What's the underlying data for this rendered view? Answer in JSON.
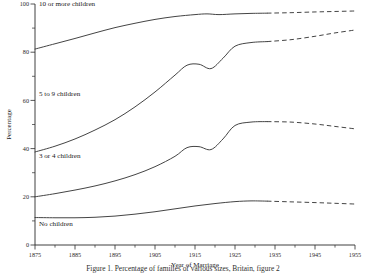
{
  "chart_data": {
    "type": "line",
    "title": "",
    "xlabel": "Year of Marriage",
    "ylabel": "Percentage",
    "xlim": [
      1875,
      1955
    ],
    "ylim": [
      0,
      100
    ],
    "grid": false,
    "legend_position": "inline-labels",
    "x_ticks": [
      "1875",
      "1885",
      "1895",
      "1905",
      "1915",
      "1925",
      "1935",
      "1945",
      "1955"
    ],
    "x_ticks_values": [
      1875,
      1885,
      1895,
      1905,
      1915,
      1925,
      1935,
      1945,
      1955
    ],
    "x_minor_step": 5,
    "y_ticks": [
      "0",
      "20",
      "40",
      "60",
      "80",
      "100"
    ],
    "y_ticks_values": [
      0,
      20,
      40,
      60,
      80,
      100
    ],
    "y_minor_step": 10,
    "projection_note": "dashed segments from 1933 onward are projected",
    "projection_start_year": 1933,
    "series": [
      {
        "name": "10 or more children",
        "label": "10 or more children",
        "label_x": 1876,
        "label_y": 99,
        "x": [
          1875,
          1880,
          1885,
          1890,
          1895,
          1900,
          1905,
          1910,
          1915,
          1918,
          1921,
          1925,
          1929,
          1933,
          1939,
          1945,
          1950,
          1955
        ],
        "values": [
          81.3,
          83.5,
          85.7,
          88.0,
          90.2,
          92.0,
          93.6,
          94.8,
          95.6,
          95.9,
          95.6,
          95.9,
          96.1,
          96.2,
          96.4,
          96.7,
          96.9,
          97.1
        ]
      },
      {
        "name": "5 to 9 children",
        "label": "5 to 9 children",
        "label_x": 1876,
        "label_y": 62,
        "x": [
          1875,
          1880,
          1885,
          1890,
          1895,
          1900,
          1905,
          1910,
          1913,
          1916,
          1919,
          1922,
          1925,
          1929,
          1933,
          1939,
          1945,
          1950,
          1955
        ],
        "values": [
          38.6,
          41.0,
          44.0,
          47.7,
          52.0,
          57.3,
          63.5,
          70.5,
          74.6,
          75.0,
          73.2,
          77.5,
          82.5,
          84.0,
          84.4,
          85.2,
          86.6,
          88.0,
          89.2
        ]
      },
      {
        "name": "3 or 4 children",
        "label": "3 or 4 children",
        "label_x": 1876,
        "label_y": 36,
        "x": [
          1875,
          1880,
          1885,
          1890,
          1895,
          1900,
          1905,
          1910,
          1913,
          1916,
          1919,
          1922,
          1925,
          1929,
          1933,
          1939,
          1945,
          1950,
          1955
        ],
        "values": [
          20.0,
          21.3,
          22.8,
          24.5,
          26.6,
          29.2,
          32.5,
          36.8,
          40.4,
          40.8,
          39.6,
          44.0,
          49.6,
          51.0,
          51.2,
          51.0,
          50.2,
          49.2,
          48.2
        ]
      },
      {
        "name": "No children",
        "label": "No children",
        "label_x": 1876,
        "label_y": 8,
        "x": [
          1875,
          1880,
          1885,
          1890,
          1895,
          1900,
          1905,
          1910,
          1915,
          1920,
          1925,
          1929,
          1933,
          1939,
          1945,
          1950,
          1955
        ],
        "values": [
          11.4,
          11.3,
          11.3,
          11.5,
          12.0,
          12.8,
          13.8,
          15.0,
          16.2,
          17.2,
          18.0,
          18.3,
          18.2,
          17.9,
          17.6,
          17.3,
          17.0
        ]
      }
    ]
  },
  "caption": {
    "text": "Figure 1. Percentage of families of various sizes, Britain, figure 2"
  }
}
